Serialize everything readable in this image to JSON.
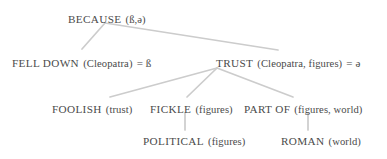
{
  "diagram": {
    "type": "tree",
    "title": "",
    "background_color": "#ffffff",
    "text_color": "#4a4a4a",
    "edge_color": "#cccccc",
    "nodes": [
      {
        "id": "because",
        "predicate": "BECAUSE",
        "arguments": "(ß,ə)",
        "full_text": "BECAUSE (ß,ə)",
        "equals": "",
        "level": 0
      },
      {
        "id": "fell-down",
        "predicate": "FELL DOWN",
        "arguments": "(Cleopatra)",
        "full_text": "FELL DOWN (Cleopatra) = ß",
        "equals": "= ß",
        "level": 1
      },
      {
        "id": "trust",
        "predicate": "TRUST",
        "arguments": "(Cleopatra, figures)",
        "full_text": "TRUST (Cleopatra, figures) = ə",
        "equals": "= ə",
        "level": 1
      },
      {
        "id": "foolish",
        "predicate": "FOOLISH",
        "arguments": "(trust)",
        "full_text": "FOOLISH (trust)",
        "equals": "",
        "level": 2
      },
      {
        "id": "fickle",
        "predicate": "FICKLE",
        "arguments": "(figures)",
        "full_text": "FICKLE (figures)",
        "equals": "",
        "level": 2
      },
      {
        "id": "part-of",
        "predicate": "PART OF",
        "arguments": "(figures, world)",
        "full_text": "PART OF (figures, world)",
        "equals": "",
        "level": 2
      },
      {
        "id": "political",
        "predicate": "POLITICAL",
        "arguments": "(figures)",
        "full_text": "POLITICAL (figures)",
        "equals": "",
        "level": 3
      },
      {
        "id": "roman",
        "predicate": "ROMAN",
        "arguments": "(world)",
        "full_text": "ROMAN (world)",
        "equals": "",
        "level": 3
      }
    ],
    "edges": [
      {
        "from": "because",
        "to": "fell-down"
      },
      {
        "from": "because",
        "to": "trust"
      },
      {
        "from": "trust",
        "to": "foolish"
      },
      {
        "from": "trust",
        "to": "fickle"
      },
      {
        "from": "trust",
        "to": "part-of"
      },
      {
        "from": "fickle",
        "to": "political"
      },
      {
        "from": "part-of",
        "to": "roman"
      }
    ]
  }
}
